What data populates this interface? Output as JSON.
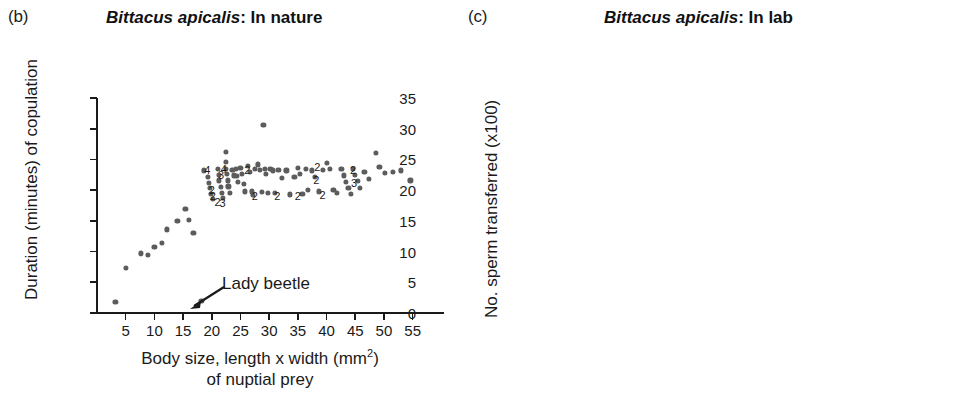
{
  "figure": {
    "background": "#ffffff",
    "dot_color": "#5c5c5c",
    "axis_color": "#1a1a1a"
  },
  "panels": [
    {
      "key": "b",
      "letter": "(b)",
      "title_species": "Bittacus apicalis",
      "title_rest": ": In nature"
    },
    {
      "key": "c",
      "letter": "(c)",
      "title_species": "Bittacus apicalis",
      "title_rest": ": In lab"
    }
  ],
  "annotations": {
    "lady_beetle": "Lady beetle"
  },
  "chart_data": [
    {
      "panel": "b",
      "type": "scatter",
      "title": "Bittacus apicalis: In nature",
      "xlabel": "Body size, length x width (mm2) of nuptial prey",
      "xlabel_line1": "Body size, length x width (mm",
      "xlabel_sup": "2",
      "xlabel_line1_tail": ")",
      "xlabel_line2": "of nuptial prey",
      "ylabel": "Duration (minutes) of copulation",
      "xlim": [
        0,
        57.5
      ],
      "ylim": [
        0,
        35
      ],
      "xticks": [
        5,
        10,
        15,
        20,
        25,
        30,
        35,
        40,
        45,
        50,
        55
      ],
      "yticks": [
        0,
        5,
        10,
        15,
        20,
        25,
        30,
        35
      ],
      "grid": false,
      "legend": "none",
      "annotation": {
        "text": "Lady beetle",
        "points_to": [
          18.2,
          2.0
        ]
      },
      "points": [
        [
          3.2,
          1.8
        ],
        [
          5.0,
          7.4
        ],
        [
          7.6,
          9.7
        ],
        [
          8.8,
          9.5
        ],
        [
          10.0,
          10.8
        ],
        [
          11.3,
          11.4
        ],
        [
          12.2,
          13.6
        ],
        [
          14.0,
          15.0
        ],
        [
          15.4,
          17.0
        ],
        [
          16.0,
          15.2
        ],
        [
          16.8,
          13.0
        ],
        [
          18.2,
          2.0
        ],
        [
          18.6,
          23.2
        ],
        [
          19.3,
          22.2
        ],
        [
          19.5,
          21.2
        ],
        [
          19.7,
          20.3
        ],
        [
          19.9,
          19.4
        ],
        [
          20.2,
          18.6
        ],
        [
          21.0,
          23.4
        ],
        [
          21.2,
          22.5
        ],
        [
          21.3,
          21.6
        ],
        [
          21.6,
          20.5
        ],
        [
          21.8,
          19.5
        ],
        [
          22.0,
          18.8
        ],
        [
          22.4,
          26.2
        ],
        [
          22.4,
          24.6
        ],
        [
          22.5,
          23.5
        ],
        [
          22.6,
          22.6
        ],
        [
          22.8,
          21.6
        ],
        [
          22.9,
          20.6
        ],
        [
          23.2,
          19.6
        ],
        [
          23.6,
          23.3
        ],
        [
          23.8,
          22.4
        ],
        [
          24.2,
          23.4
        ],
        [
          24.3,
          22.3
        ],
        [
          24.6,
          21.4
        ],
        [
          25.0,
          23.6
        ],
        [
          25.3,
          22.6
        ],
        [
          25.6,
          21.0
        ],
        [
          25.8,
          19.8
        ],
        [
          26.3,
          24.0
        ],
        [
          26.6,
          23.0
        ],
        [
          27.0,
          19.8
        ],
        [
          27.2,
          19.2
        ],
        [
          27.5,
          23.5
        ],
        [
          28.0,
          24.2
        ],
        [
          28.4,
          23.3
        ],
        [
          28.8,
          19.7
        ],
        [
          29.0,
          30.6
        ],
        [
          29.2,
          23.5
        ],
        [
          29.5,
          22.6
        ],
        [
          29.8,
          19.6
        ],
        [
          30.2,
          23.4
        ],
        [
          30.6,
          23.2
        ],
        [
          31.0,
          19.5
        ],
        [
          31.6,
          23.3
        ],
        [
          32.2,
          22.0
        ],
        [
          33.0,
          23.2
        ],
        [
          33.6,
          19.3
        ],
        [
          34.4,
          22.2
        ],
        [
          35.0,
          23.6
        ],
        [
          35.4,
          22.6
        ],
        [
          35.8,
          19.4
        ],
        [
          36.4,
          23.4
        ],
        [
          36.8,
          20.1
        ],
        [
          37.4,
          23.2
        ],
        [
          38.0,
          22.2
        ],
        [
          38.6,
          19.8
        ],
        [
          39.4,
          23.3
        ],
        [
          40.0,
          24.4
        ],
        [
          40.6,
          23.4
        ],
        [
          41.2,
          20.0
        ],
        [
          41.8,
          19.6
        ],
        [
          42.6,
          23.5
        ],
        [
          43.0,
          22.4
        ],
        [
          43.4,
          21.3
        ],
        [
          43.8,
          20.3
        ],
        [
          44.2,
          19.4
        ],
        [
          44.6,
          23.4
        ],
        [
          45.0,
          22.5
        ],
        [
          45.4,
          21.5
        ],
        [
          45.8,
          20.4
        ],
        [
          46.6,
          23.0
        ],
        [
          47.4,
          21.8
        ],
        [
          48.6,
          26.1
        ],
        [
          49.2,
          23.8
        ],
        [
          50.2,
          22.8
        ],
        [
          51.6,
          23.0
        ],
        [
          53.0,
          23.2
        ],
        [
          54.6,
          21.6
        ]
      ],
      "overlap_labels": [
        {
          "text": "4",
          "x": 19.2,
          "y": 23.3
        },
        {
          "text": "4",
          "x": 22.1,
          "y": 23.4
        },
        {
          "text": "3",
          "x": 21.6,
          "y": 22.4
        },
        {
          "text": "2",
          "x": 20.0,
          "y": 20.1
        },
        {
          "text": "2",
          "x": 20.2,
          "y": 19.0
        },
        {
          "text": "2",
          "x": 21.0,
          "y": 18.1
        },
        {
          "text": "3",
          "x": 21.9,
          "y": 17.9
        },
        {
          "text": "2",
          "x": 26.2,
          "y": 23.2
        },
        {
          "text": "2",
          "x": 27.5,
          "y": 19.1
        },
        {
          "text": "2",
          "x": 31.4,
          "y": 19.0
        },
        {
          "text": "2",
          "x": 35.0,
          "y": 19.1
        },
        {
          "text": "2",
          "x": 38.4,
          "y": 23.8
        },
        {
          "text": "2",
          "x": 38.2,
          "y": 21.6
        },
        {
          "text": "2",
          "x": 39.3,
          "y": 19.2
        },
        {
          "text": "2",
          "x": 44.6,
          "y": 23.3
        },
        {
          "text": "3",
          "x": 44.8,
          "y": 21.2
        }
      ]
    },
    {
      "panel": "c",
      "type": "scatter",
      "title": "Bittacus apicalis: In lab",
      "xlabel": "Duration of copulation (minutes)",
      "ylabel": "No. sperm transferred (x100)",
      "xlim": [
        0,
        40.5
      ],
      "ylim": [
        0,
        24
      ],
      "xticks": [
        1,
        3,
        5,
        7,
        9,
        11,
        13,
        15,
        17,
        19,
        21,
        23,
        25,
        27,
        29,
        31,
        33,
        35,
        37,
        39
      ],
      "yticks": [
        0,
        2,
        4,
        6,
        8,
        10,
        12,
        14,
        16,
        18,
        20,
        22,
        24
      ],
      "grid": false,
      "legend": "none",
      "points": [
        [
          0.8,
          0.2
        ],
        [
          1.2,
          0.2
        ],
        [
          2.0,
          0.2
        ],
        [
          2.6,
          0.2
        ],
        [
          3.6,
          0.2
        ],
        [
          4.2,
          0.25
        ],
        [
          4.9,
          0.3
        ],
        [
          5.0,
          0.7
        ],
        [
          5.6,
          1.9
        ],
        [
          5.7,
          2.5
        ],
        [
          6.2,
          3.0
        ],
        [
          6.4,
          3.1
        ],
        [
          6.6,
          1.2
        ],
        [
          7.0,
          3.2
        ],
        [
          7.3,
          4.0
        ],
        [
          7.6,
          4.4
        ],
        [
          7.9,
          4.8
        ],
        [
          8.2,
          5.0
        ],
        [
          8.5,
          5.6
        ],
        [
          8.8,
          6.0
        ],
        [
          9.1,
          6.2
        ],
        [
          9.4,
          6.6
        ],
        [
          9.7,
          7.0
        ],
        [
          10.0,
          7.2
        ],
        [
          10.4,
          8.0
        ],
        [
          10.8,
          8.4
        ],
        [
          11.2,
          8.6
        ],
        [
          11.5,
          9.0
        ],
        [
          11.8,
          9.4
        ],
        [
          12.2,
          9.8
        ],
        [
          12.6,
          10.0
        ],
        [
          12.9,
          10.6
        ],
        [
          13.2,
          11.0
        ],
        [
          13.5,
          11.4
        ],
        [
          13.9,
          11.8
        ],
        [
          14.2,
          12.2
        ],
        [
          14.5,
          12.6
        ],
        [
          14.8,
          13.2
        ],
        [
          15.2,
          14.0
        ],
        [
          15.6,
          14.2
        ],
        [
          16.0,
          15.4
        ],
        [
          16.3,
          15.2
        ],
        [
          16.6,
          15.6
        ],
        [
          16.9,
          15.1
        ],
        [
          17.3,
          16.4
        ],
        [
          17.6,
          17.6
        ],
        [
          17.8,
          17.2
        ],
        [
          18.2,
          17.1
        ],
        [
          18.6,
          17.5
        ],
        [
          18.9,
          17.8
        ],
        [
          19.2,
          18.0
        ],
        [
          19.5,
          18.4
        ],
        [
          19.8,
          18.9
        ],
        [
          20.4,
          21.2
        ],
        [
          21.2,
          23.4
        ],
        [
          22.0,
          22.2
        ],
        [
          22.6,
          20.5
        ],
        [
          22.7,
          20.1
        ],
        [
          23.2,
          19.4
        ],
        [
          23.5,
          19.8
        ],
        [
          24.0,
          23.1
        ],
        [
          24.4,
          21.4
        ],
        [
          24.8,
          18.6
        ],
        [
          25.2,
          21.8
        ],
        [
          25.6,
          21.0
        ],
        [
          26.2,
          19.5
        ],
        [
          27.0,
          22.4
        ],
        [
          27.4,
          19.5
        ],
        [
          28.6,
          21.9
        ],
        [
          29.6,
          20.3
        ],
        [
          32.0,
          20.8
        ],
        [
          34.8,
          23.1
        ],
        [
          37.6,
          20.8
        ],
        [
          39.2,
          20.8
        ]
      ],
      "overlap_labels": [
        {
          "text": "3",
          "x": 0.9,
          "y": 0.55
        },
        {
          "text": "2",
          "x": 1.7,
          "y": 0.55
        },
        {
          "text": "2",
          "x": 3.0,
          "y": 0.55
        }
      ]
    }
  ]
}
